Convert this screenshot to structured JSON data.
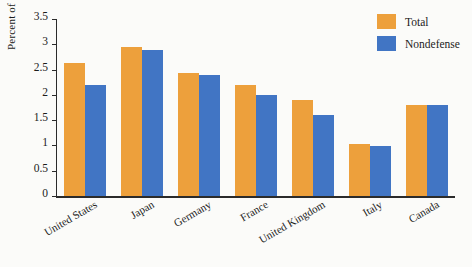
{
  "chart_data": {
    "type": "bar",
    "title": "",
    "subtitle": "",
    "xlabel": "",
    "ylabel": "Percent of GDP",
    "ylim": [
      0,
      3.5
    ],
    "ytick_step": 0.5,
    "yticks": [
      "3.5",
      "3",
      "2.5",
      "2",
      "1.5",
      "1",
      "0.5",
      "0"
    ],
    "ytick_values": [
      3.5,
      3,
      2.5,
      2,
      1.5,
      1,
      0.5,
      0
    ],
    "grid": false,
    "legend_position": "top-right",
    "categories": [
      "United States",
      "Japan",
      "Germany",
      "France",
      "United Kingdom",
      "Italy",
      "Canada"
    ],
    "series": [
      {
        "name": "Total",
        "color": "#eda03c",
        "values": [
          2.63,
          2.94,
          2.44,
          2.2,
          1.9,
          1.02,
          1.8
        ]
      },
      {
        "name": "Nondefense",
        "color": "#4175c4",
        "values": [
          2.2,
          2.89,
          2.4,
          2.0,
          1.6,
          0.98,
          1.8
        ]
      }
    ]
  },
  "legend": {
    "items": [
      {
        "label": "Total",
        "color": "#eda03c"
      },
      {
        "label": "Nondefense",
        "color": "#4175c4"
      }
    ]
  },
  "colors": {
    "total": "#eda03c",
    "nondefense": "#4175c4",
    "axis": "#2b2b2b",
    "background": "#fbfbf9",
    "text": "#1c1c1c"
  }
}
